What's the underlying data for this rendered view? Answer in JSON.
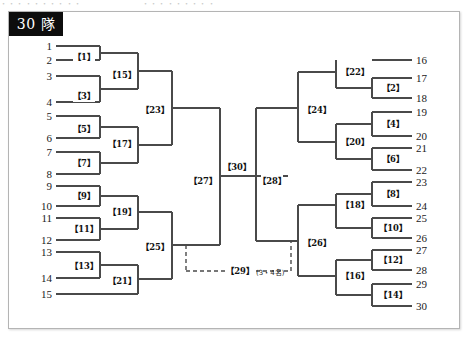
{
  "document": {
    "top_strip_left": "・・・・・・・・・・",
    "top_strip_right": "・・・・・・・・・"
  },
  "bracket": {
    "title": "30 隊",
    "third_place_label": "【29】",
    "third_place_note": "(3・4名)",
    "left_seeds": [
      {
        "label": "1",
        "y": 46
      },
      {
        "label": "2",
        "y": 60
      },
      {
        "label": "3",
        "y": 76
      },
      {
        "label": "4",
        "y": 102
      },
      {
        "label": "5",
        "y": 116
      },
      {
        "label": "6",
        "y": 138
      },
      {
        "label": "7",
        "y": 152
      },
      {
        "label": "8",
        "y": 174
      },
      {
        "label": "9",
        "y": 186
      },
      {
        "label": "10",
        "y": 206
      },
      {
        "label": "11",
        "y": 218
      },
      {
        "label": "12",
        "y": 240
      },
      {
        "label": "13",
        "y": 252
      },
      {
        "label": "14",
        "y": 278
      },
      {
        "label": "15",
        "y": 294
      }
    ],
    "right_seeds": [
      {
        "label": "16",
        "y": 60
      },
      {
        "label": "17",
        "y": 78
      },
      {
        "label": "18",
        "y": 98
      },
      {
        "label": "19",
        "y": 112
      },
      {
        "label": "20",
        "y": 136
      },
      {
        "label": "21",
        "y": 148
      },
      {
        "label": "22",
        "y": 170
      },
      {
        "label": "23",
        "y": 182
      },
      {
        "label": "24",
        "y": 206
      },
      {
        "label": "25",
        "y": 218
      },
      {
        "label": "26",
        "y": 238
      },
      {
        "label": "27",
        "y": 250
      },
      {
        "label": "28",
        "y": 270
      },
      {
        "label": "29",
        "y": 284
      },
      {
        "label": "30",
        "y": 306
      }
    ],
    "matches": [
      {
        "id": "m1",
        "label": "【1】",
        "x": 84,
        "y": 57
      },
      {
        "id": "m3",
        "label": "【3】",
        "x": 84,
        "y": 96
      },
      {
        "id": "m5",
        "label": "【5】",
        "x": 84,
        "y": 129
      },
      {
        "id": "m7",
        "label": "【7】",
        "x": 84,
        "y": 163
      },
      {
        "id": "m9",
        "label": "【9】",
        "x": 84,
        "y": 196
      },
      {
        "id": "m11",
        "label": "【11】",
        "x": 84,
        "y": 229
      },
      {
        "id": "m13",
        "label": "【13】",
        "x": 84,
        "y": 266
      },
      {
        "id": "m15",
        "label": "【15】",
        "x": 122,
        "y": 75
      },
      {
        "id": "m17",
        "label": "【17】",
        "x": 122,
        "y": 144
      },
      {
        "id": "m19",
        "label": "【19】",
        "x": 122,
        "y": 212
      },
      {
        "id": "m21",
        "label": "【21】",
        "x": 122,
        "y": 281
      },
      {
        "id": "m23",
        "label": "【23】",
        "x": 155,
        "y": 110
      },
      {
        "id": "m25",
        "label": "【25】",
        "x": 155,
        "y": 247
      },
      {
        "id": "m27",
        "label": "【27】",
        "x": 203,
        "y": 181
      },
      {
        "id": "m30",
        "label": "【30】",
        "x": 237,
        "y": 167
      },
      {
        "id": "m28",
        "label": "【28】",
        "x": 272,
        "y": 181
      },
      {
        "id": "m24",
        "label": "【24】",
        "x": 317,
        "y": 110
      },
      {
        "id": "m26",
        "label": "【26】",
        "x": 317,
        "y": 243
      },
      {
        "id": "m22",
        "label": "【22】",
        "x": 355,
        "y": 72
      },
      {
        "id": "m20",
        "label": "【20】",
        "x": 355,
        "y": 142
      },
      {
        "id": "m18",
        "label": "【18】",
        "x": 355,
        "y": 205
      },
      {
        "id": "m16",
        "label": "【16】",
        "x": 355,
        "y": 276
      },
      {
        "id": "m2",
        "label": "【2】",
        "x": 393,
        "y": 88
      },
      {
        "id": "m4",
        "label": "【4】",
        "x": 393,
        "y": 124
      },
      {
        "id": "m6",
        "label": "【6】",
        "x": 393,
        "y": 159
      },
      {
        "id": "m8",
        "label": "【8】",
        "x": 393,
        "y": 194
      },
      {
        "id": "m10",
        "label": "【10】",
        "x": 393,
        "y": 228
      },
      {
        "id": "m12",
        "label": "【12】",
        "x": 393,
        "y": 260
      },
      {
        "id": "m14",
        "label": "【14】",
        "x": 393,
        "y": 295
      }
    ],
    "lines": [
      "M56,46 H100",
      "M56,60 H100",
      "M100,46 V60",
      "M56,76 H100",
      "M56,102 H100",
      "M100,76 V102",
      "M100,53 H138",
      "M100,89 H138",
      "M138,53 V89",
      "M56,116 H100",
      "M56,138 H100",
      "M100,116 V138",
      "M56,152 H100",
      "M56,174 H100",
      "M100,152 V174",
      "M100,127 H138",
      "M100,163 H138",
      "M138,127 V163",
      "M138,71 H172",
      "M138,145 H172",
      "M172,71 V145",
      "M56,186 H100",
      "M56,206 H100",
      "M100,186 V206",
      "M56,218 H100",
      "M56,240 H100",
      "M100,218 V240",
      "M100,196 H138",
      "M100,229 H138",
      "M138,196 V229",
      "M56,252 H100",
      "M56,278 H100",
      "M100,252 V278",
      "M100,265 H138",
      "M56,294 H138",
      "M138,265 V294",
      "M138,212 H172",
      "M138,279 H172",
      "M172,212 V279",
      "M172,108 H220",
      "M172,245 H220",
      "M220,108 V245",
      "M220,176 H256",
      "M412,60 H372",
      "M412,78 H372",
      "M412,98 H372",
      "M372,78 V98",
      "M372,88 H336",
      "M336,60 V88",
      "M336,72 H298",
      "M412,112 H372",
      "M412,136 H372",
      "M372,112 V136",
      "M412,148 H372",
      "M412,170 H372",
      "M372,148 V170",
      "M372,124 H336",
      "M372,159 H336",
      "M336,124 V159",
      "M336,142 H298",
      "M298,72 V142",
      "M298,108 H256",
      "M256,108 V176",
      "M412,182 H372",
      "M412,206 H372",
      "M372,182 V206",
      "M412,218 H372",
      "M412,238 H372",
      "M372,218 V238",
      "M372,194 H336",
      "M372,228 H336",
      "M336,194 V228",
      "M336,205 H298",
      "M412,250 H372",
      "M412,270 H372",
      "M372,250 V270",
      "M412,284 H372",
      "M412,306 H372",
      "M372,284 V306",
      "M372,260 H336",
      "M372,295 H336",
      "M336,260 V295",
      "M336,276 H298",
      "M298,205 V276",
      "M298,241 H256",
      "M256,176 V241",
      "M256,176 H288"
    ],
    "dashed_lines": [
      "M186,245 V271",
      "M186,271 H291",
      "M291,271 V241"
    ]
  }
}
